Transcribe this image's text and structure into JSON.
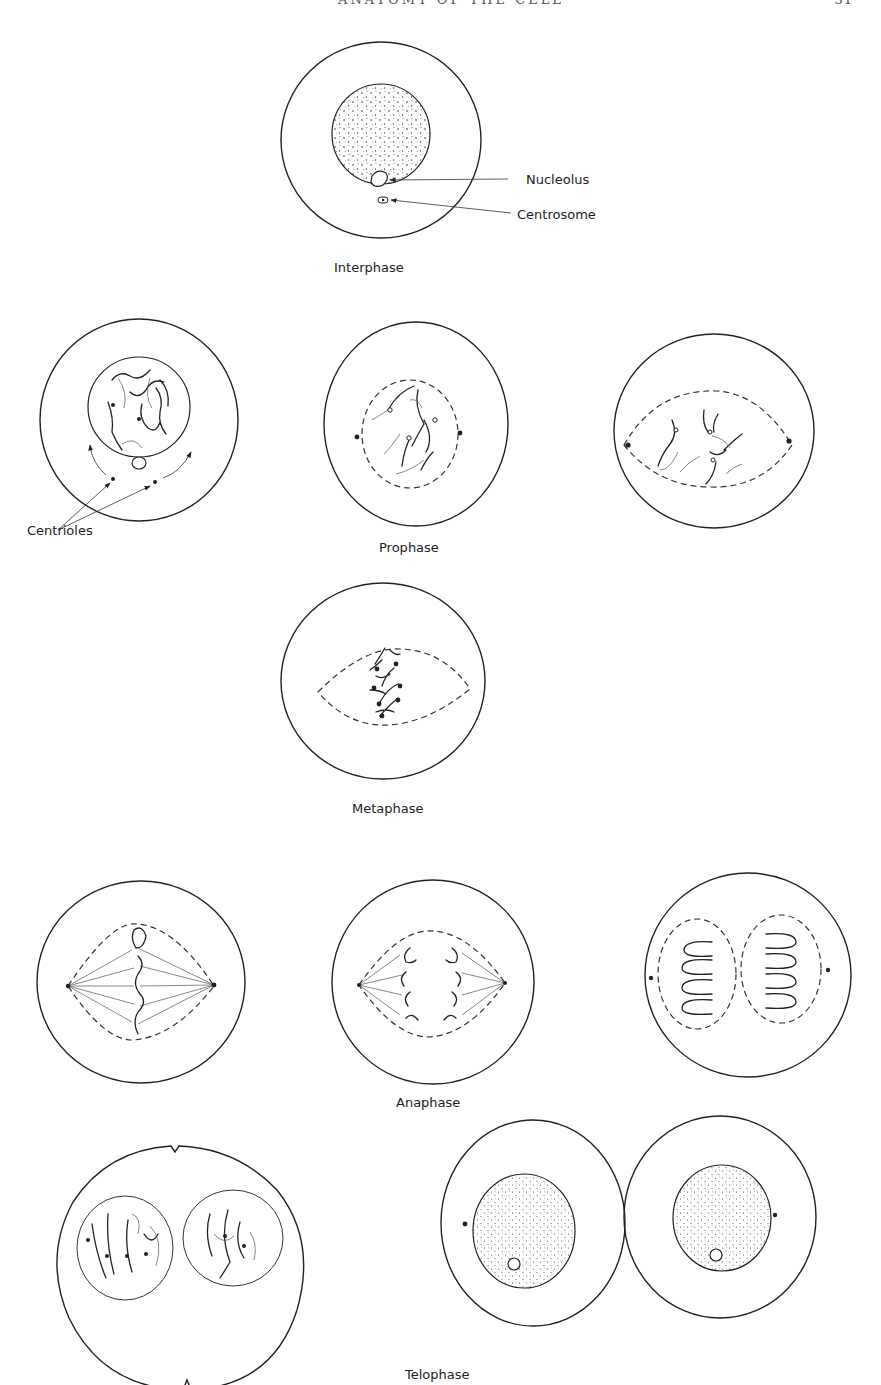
{
  "page": {
    "running_head": "ANATOMY OF THE CELL",
    "page_number": "31"
  },
  "diagram": {
    "stages": [
      {
        "id": "interphase",
        "label": "Interphase",
        "cells": 1
      },
      {
        "id": "prophase",
        "label": "Prophase",
        "cells": 3
      },
      {
        "id": "metaphase",
        "label": "Metaphase",
        "cells": 1
      },
      {
        "id": "anaphase",
        "label": "Anaphase",
        "cells": 3
      },
      {
        "id": "telophase",
        "label": "Telophase",
        "cells": 2
      }
    ],
    "annotations": {
      "nucleolus": "Nucleolus",
      "centrosome": "Centrosome",
      "centrioles": "Centrioles"
    },
    "colors": {
      "ink": "#222222",
      "paper": "#ffffff"
    }
  }
}
